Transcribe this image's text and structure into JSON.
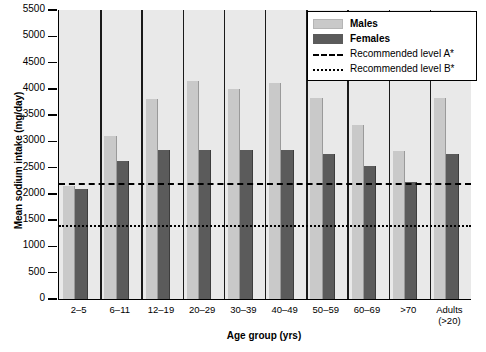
{
  "chart_data": {
    "type": "bar",
    "title": "",
    "xlabel": "Age group (yrs)",
    "ylabel": "Mean sodium intake (mg/day)",
    "ylim": [
      0,
      5500
    ],
    "ytick_step": 500,
    "yticks": [
      0,
      500,
      1000,
      1500,
      2000,
      2500,
      3000,
      3500,
      4000,
      4500,
      5000,
      5500
    ],
    "ytick_labels": [
      "0",
      "500",
      "1000",
      "1500",
      "2000",
      "2500",
      "3000",
      "3500",
      "4000",
      "4500",
      "5000",
      "5500"
    ],
    "grid": false,
    "legend_position": "top-right",
    "categories": [
      "2–5",
      "6–11",
      "12–19",
      "20–29",
      "30–39",
      "40–49",
      "50–59",
      "60–69",
      ">70",
      "Adults\n(>20)"
    ],
    "series": [
      {
        "name": "Males",
        "color": "#c9c9c9",
        "values": [
          2150,
          3100,
          3800,
          4150,
          4000,
          4120,
          3820,
          3320,
          2820,
          3820
        ]
      },
      {
        "name": "Females",
        "color": "#5b5b5b",
        "values": [
          2100,
          2620,
          2830,
          2830,
          2830,
          2830,
          2760,
          2530,
          2220,
          2760
        ]
      }
    ],
    "reference_lines": [
      {
        "name": "Recommended level A*",
        "value": 2200,
        "style": "dashed",
        "color": "#000000"
      },
      {
        "name": "Recommended level B*",
        "value": 1400,
        "style": "dotted",
        "color": "#000000"
      }
    ],
    "legend_entries": [
      {
        "label": "Males",
        "type": "swatch",
        "swatch": "male",
        "bold": true
      },
      {
        "label": "Females",
        "type": "swatch",
        "swatch": "female",
        "bold": true
      },
      {
        "label": "Recommended level A*",
        "type": "line",
        "style": "dashed",
        "bold": false
      },
      {
        "label": "Recommended level B*",
        "type": "line",
        "style": "dotted",
        "bold": false
      }
    ],
    "plot_background": "#e9e9e9",
    "axis_color": "#000000"
  }
}
